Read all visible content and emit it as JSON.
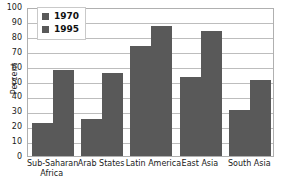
{
  "chart_data": {
    "type": "bar",
    "title": "",
    "xlabel": "",
    "ylabel": "Percent",
    "ylim": [
      0,
      100
    ],
    "ytick_values": [
      100,
      90,
      80,
      70,
      60,
      50,
      40,
      30,
      20,
      10,
      0
    ],
    "ytick_labels": [
      "100",
      "90",
      "80",
      "70",
      "60",
      "50",
      "40",
      "30",
      "20",
      "10",
      "0"
    ],
    "grid": true,
    "legend_position": "top-left-inside",
    "categories": [
      "Sub-Saharan Africa",
      "Arab States",
      "Latin America",
      "East Asia",
      "South Asia"
    ],
    "category_lines": [
      [
        "Sub-Saharan",
        "Africa"
      ],
      [
        "Arab States"
      ],
      [
        "Latin America"
      ],
      [
        "East Asia"
      ],
      [
        "South Asia"
      ]
    ],
    "series": [
      {
        "name": "1970",
        "color": "#595959",
        "values": [
          22,
          25,
          74,
          53,
          31
        ]
      },
      {
        "name": "1995",
        "color": "#595959",
        "values": [
          58,
          56,
          87,
          84,
          51
        ]
      }
    ]
  },
  "legend": {
    "entries": [
      {
        "label": "1970",
        "swatch": "legend-swatch-1970"
      },
      {
        "label": "1995",
        "swatch": "legend-swatch-1995"
      }
    ]
  },
  "colors": {
    "bar": "#595959",
    "gridline": "#bdbdbd",
    "frame": "#b0b0b0",
    "background": "#ffffff",
    "text": "#1a1a1a"
  }
}
